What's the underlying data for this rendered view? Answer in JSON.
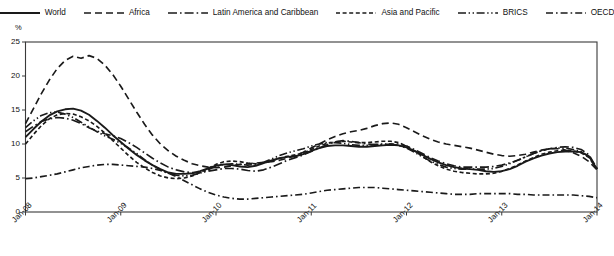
{
  "chart_data": {
    "type": "line",
    "title": "",
    "xlabel": "",
    "ylabel": "%",
    "ylim": [
      0,
      25
    ],
    "yticks": [
      0,
      5,
      10,
      15,
      20,
      25
    ],
    "xticks": [
      "Jan-08",
      "Jan-09",
      "Jan-10",
      "Jan-11",
      "Jan-12",
      "Jan-13",
      "Jan-14"
    ],
    "x_start": "Jan-08",
    "x_end": "Jan-14",
    "x_frequency": "monthly",
    "x_count": 73,
    "grid": false,
    "legend_position": "top",
    "series": [
      {
        "name": "World",
        "dash": "solid",
        "color": "#1a1a1a",
        "values": [
          11.0,
          12.2,
          13.3,
          14.2,
          14.8,
          15.1,
          15.2,
          14.9,
          14.3,
          13.4,
          12.4,
          11.3,
          10.3,
          9.3,
          8.4,
          7.6,
          6.9,
          6.3,
          5.8,
          5.6,
          5.6,
          5.7,
          6.0,
          6.4,
          6.8,
          7.0,
          6.9,
          6.7,
          6.6,
          6.8,
          7.2,
          7.6,
          7.9,
          8.1,
          8.2,
          8.5,
          9.0,
          9.4,
          9.7,
          9.8,
          9.8,
          9.7,
          9.6,
          9.6,
          9.7,
          9.8,
          9.9,
          9.8,
          9.5,
          9.0,
          8.4,
          7.8,
          7.3,
          6.9,
          6.6,
          6.4,
          6.3,
          6.2,
          6.0,
          5.9,
          6.0,
          6.3,
          6.8,
          7.4,
          7.9,
          8.3,
          8.6,
          8.8,
          8.9,
          8.9,
          8.8,
          8.2,
          6.3
        ]
      },
      {
        "name": "Africa",
        "dash": "dashed",
        "color": "#1a1a1a",
        "values": [
          13.0,
          15.2,
          17.4,
          19.4,
          21.1,
          22.3,
          22.9,
          22.6,
          23.0,
          22.6,
          21.6,
          20.2,
          18.5,
          16.6,
          14.7,
          12.9,
          11.3,
          10.0,
          9.0,
          8.2,
          7.6,
          7.1,
          6.8,
          6.6,
          6.5,
          6.6,
          6.8,
          7.0,
          7.1,
          7.2,
          7.3,
          7.4,
          7.6,
          7.9,
          8.3,
          8.8,
          9.4,
          10.0,
          10.6,
          11.1,
          11.5,
          11.8,
          12.0,
          12.3,
          12.7,
          13.0,
          13.1,
          12.9,
          12.4,
          11.8,
          11.2,
          10.7,
          10.3,
          10.0,
          9.8,
          9.6,
          9.4,
          9.1,
          8.8,
          8.5,
          8.3,
          8.2,
          8.3,
          8.5,
          8.8,
          9.1,
          9.3,
          9.3,
          9.1,
          8.7,
          8.2,
          7.4,
          6.2
        ]
      },
      {
        "name": "Latin America and Caribbean",
        "dash": "long-dash-dot",
        "color": "#1a1a1a",
        "values": [
          11.8,
          12.6,
          13.3,
          13.7,
          13.9,
          13.8,
          13.5,
          13.0,
          12.4,
          11.9,
          11.5,
          11.2,
          10.8,
          10.2,
          9.5,
          8.7,
          7.9,
          7.2,
          6.6,
          6.2,
          5.9,
          5.8,
          5.8,
          6.0,
          6.2,
          6.4,
          6.4,
          6.3,
          6.1,
          6.0,
          6.2,
          6.6,
          7.1,
          7.6,
          8.0,
          8.4,
          8.9,
          9.4,
          9.9,
          10.3,
          10.5,
          10.4,
          10.2,
          10.0,
          9.9,
          9.9,
          10.0,
          10.0,
          9.7,
          9.2,
          8.6,
          8.0,
          7.5,
          7.1,
          6.8,
          6.6,
          6.6,
          6.6,
          6.6,
          6.7,
          6.9,
          7.2,
          7.6,
          8.1,
          8.6,
          9.0,
          9.3,
          9.5,
          9.6,
          9.5,
          9.2,
          8.4,
          6.4
        ]
      },
      {
        "name": "Asia and Pacific",
        "dash": "short-dash",
        "color": "#1a1a1a",
        "values": [
          10.0,
          11.4,
          12.7,
          13.7,
          14.3,
          14.5,
          14.4,
          14.0,
          13.4,
          12.6,
          11.6,
          10.5,
          9.4,
          8.3,
          7.3,
          6.5,
          5.8,
          5.3,
          5.0,
          4.9,
          5.0,
          5.3,
          5.8,
          6.4,
          7.0,
          7.4,
          7.5,
          7.4,
          7.2,
          7.1,
          7.2,
          7.5,
          7.9,
          8.2,
          8.4,
          8.7,
          9.2,
          9.7,
          10.1,
          10.3,
          10.4,
          10.3,
          10.2,
          10.2,
          10.3,
          10.4,
          10.4,
          10.2,
          9.7,
          9.0,
          8.2,
          7.4,
          6.8,
          6.3,
          6.0,
          5.8,
          5.7,
          5.6,
          5.6,
          5.7,
          6.0,
          6.4,
          6.9,
          7.5,
          8.0,
          8.5,
          8.8,
          9.0,
          9.1,
          9.0,
          8.7,
          8.0,
          6.3
        ]
      },
      {
        "name": "BRICS",
        "dash": "dash-dot-dot",
        "color": "#1a1a1a",
        "values": [
          12.4,
          13.4,
          14.2,
          14.6,
          14.7,
          14.4,
          13.9,
          13.2,
          12.5,
          11.8,
          11.2,
          10.7,
          10.1,
          9.4,
          8.6,
          7.7,
          6.9,
          6.2,
          5.7,
          5.4,
          5.3,
          5.4,
          5.7,
          6.2,
          6.7,
          7.0,
          7.1,
          7.0,
          6.9,
          7.0,
          7.3,
          7.8,
          8.3,
          8.7,
          9.0,
          9.3,
          9.7,
          10.0,
          10.2,
          10.2,
          10.1,
          9.9,
          9.8,
          9.8,
          9.9,
          10.0,
          10.0,
          9.8,
          9.4,
          8.8,
          8.1,
          7.5,
          7.0,
          6.6,
          6.4,
          6.3,
          6.3,
          6.3,
          6.3,
          6.4,
          6.7,
          7.1,
          7.6,
          8.1,
          8.6,
          9.0,
          9.3,
          9.4,
          9.4,
          9.2,
          8.9,
          8.1,
          6.3
        ]
      },
      {
        "name": "OECD",
        "dash": "dash-dot",
        "color": "#1a1a1a",
        "values": [
          4.9,
          5.0,
          5.2,
          5.4,
          5.6,
          5.9,
          6.2,
          6.5,
          6.7,
          6.9,
          7.0,
          7.0,
          6.9,
          6.8,
          6.7,
          6.6,
          6.4,
          6.1,
          5.7,
          5.2,
          4.6,
          4.0,
          3.4,
          2.9,
          2.5,
          2.2,
          2.0,
          1.9,
          1.9,
          2.0,
          2.1,
          2.2,
          2.3,
          2.4,
          2.5,
          2.6,
          2.8,
          3.0,
          3.2,
          3.3,
          3.4,
          3.5,
          3.6,
          3.6,
          3.6,
          3.5,
          3.4,
          3.3,
          3.2,
          3.1,
          3.0,
          2.9,
          2.8,
          2.7,
          2.6,
          2.6,
          2.6,
          2.7,
          2.7,
          2.7,
          2.7,
          2.7,
          2.6,
          2.6,
          2.5,
          2.5,
          2.5,
          2.5,
          2.5,
          2.5,
          2.4,
          2.3,
          2.1
        ]
      }
    ]
  },
  "legend": {
    "items": [
      {
        "label": "World",
        "dash": "solid"
      },
      {
        "label": "Africa",
        "dash": "dashed"
      },
      {
        "label": "Latin America and Caribbean",
        "dash": "long-dash-dot"
      },
      {
        "label": "Asia and Pacific",
        "dash": "short-dash"
      },
      {
        "label": "BRICS",
        "dash": "dash-dot-dot"
      },
      {
        "label": "OECD",
        "dash": "dash-dot"
      }
    ]
  },
  "axes": {
    "y_unit": "%",
    "y_labels": [
      "25",
      "20",
      "15",
      "10",
      "5",
      "0"
    ],
    "x_labels": [
      "Jan-08",
      "Jan-09",
      "Jan-10",
      "Jan-11",
      "Jan-12",
      "Jan-13",
      "Jan-14"
    ]
  }
}
